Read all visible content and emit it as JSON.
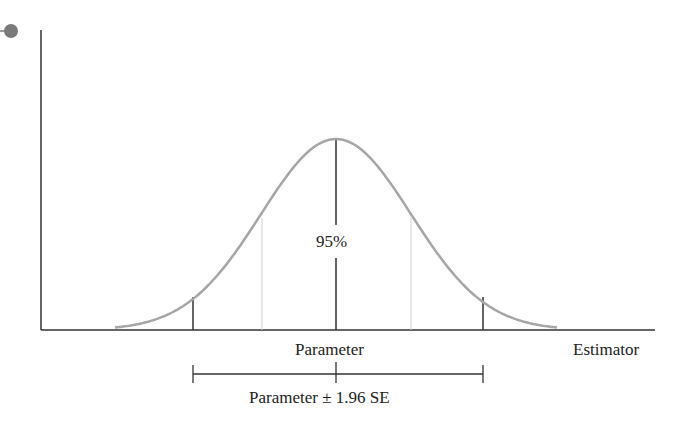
{
  "diagram": {
    "title": "",
    "center_label": "95%",
    "axis_label_center": "Parameter",
    "axis_label_right": "Estimator",
    "interval_label": "Parameter ± 1.96 SE",
    "colors": {
      "curve": "#a6a6a6",
      "axis": "#333333",
      "inflection_lines": "#cfcfcf",
      "bullet": "#7a7a7a"
    }
  },
  "chart_data": {
    "type": "line",
    "title": "",
    "xlabel": "Estimator",
    "ylabel": "",
    "series": [
      {
        "name": "Sampling distribution (normal density)",
        "mean_label": "Parameter",
        "sd_label": "SE"
      }
    ],
    "annotations": [
      {
        "text": "95%",
        "position": "center under curve"
      },
      {
        "text": "Parameter",
        "position": "x-axis at mean"
      },
      {
        "text": "Parameter ± 1.96 SE",
        "position": "interval bracket below axis"
      }
    ],
    "reference_lines": [
      {
        "x": "-1.96 SE",
        "style": "solid dark"
      },
      {
        "x": "-1 SE",
        "style": "thin light"
      },
      {
        "x": "mean",
        "style": "solid dark"
      },
      {
        "x": "+1 SE",
        "style": "thin light"
      },
      {
        "x": "+1.96 SE",
        "style": "solid dark"
      }
    ],
    "grid": false,
    "legend": "none"
  }
}
